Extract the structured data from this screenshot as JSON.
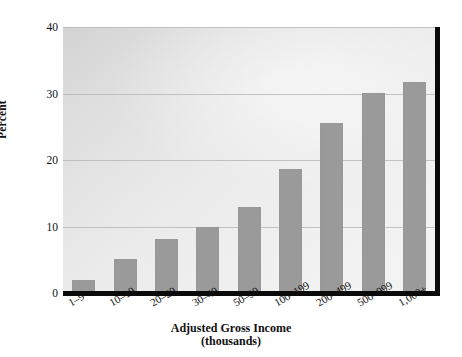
{
  "chart_data": {
    "type": "bar",
    "title": "",
    "xlabel": "Adjusted Gross Income",
    "xlabel_sub": "(thousands)",
    "ylabel": "Percent",
    "ylim": [
      0,
      40
    ],
    "yticks": [
      0,
      10,
      20,
      30,
      40
    ],
    "ytick_labels": [
      "0",
      "10",
      "20",
      "30",
      "40"
    ],
    "grid": true,
    "grid_axis": "y",
    "legend": false,
    "categories": [
      "1–9",
      "10–19",
      "20–29",
      "30–49",
      "50–99",
      "100–199",
      "200–499",
      "500–999",
      "1,000+"
    ],
    "values": [
      2.0,
      5.1,
      8.1,
      10.0,
      12.9,
      18.6,
      25.5,
      30.1,
      31.7
    ],
    "bar_color": "#9a9a9a",
    "axis_color": "#0a0a0a",
    "gridline_color": "#b9b9b9",
    "plot_background": "#e6e6e6"
  }
}
